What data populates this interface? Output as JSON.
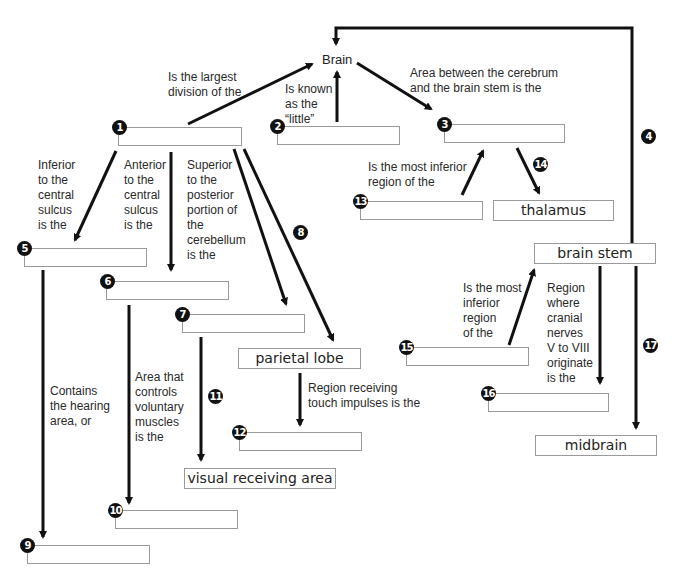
{
  "title": "Brain",
  "blanks": {
    "b1": {
      "number": "1",
      "value": ""
    },
    "b2": {
      "number": "2",
      "value": ""
    },
    "b3": {
      "number": "3",
      "value": ""
    },
    "b5": {
      "number": "5",
      "value": ""
    },
    "b6": {
      "number": "6",
      "value": ""
    },
    "b7": {
      "number": "7",
      "value": ""
    },
    "b9": {
      "number": "9",
      "value": ""
    },
    "b10": {
      "number": "10",
      "value": ""
    },
    "b12": {
      "number": "12",
      "value": ""
    },
    "b13": {
      "number": "13",
      "value": ""
    },
    "b15": {
      "number": "15",
      "value": ""
    },
    "b16": {
      "number": "16",
      "value": ""
    }
  },
  "filled": {
    "thalamus": "thalamus",
    "brain_stem": "brain stem",
    "parietal_lobe": "parietal lobe",
    "visual_receiving_area": "visual receiving area",
    "midbrain": "midbrain"
  },
  "arrow_numbers": {
    "a4": "4",
    "a8": "8",
    "a11": "11",
    "a14": "14",
    "a17": "17"
  },
  "labels": {
    "largest_division": "Is the largest\ndivision of the",
    "known_as_little": "Is known\nas the\n“little”",
    "area_between": "Area between the cerebrum\nand the brain stem is the",
    "inferior_central": "Inferior\nto the\ncentral\nsulcus\nis the",
    "anterior_central": "Anterior\nto the\ncentral\nsulcus\nis the",
    "superior_posterior": "Superior\nto the\nposterior\nportion of\nthe\ncerebellum\nis the",
    "most_inferior_region_13": "Is the most inferior\nregion of the",
    "hearing_area": "Contains\nthe hearing\narea, or",
    "voluntary_muscles": "Area that\ncontrols\nvoluntary\nmuscles\nis the",
    "touch_impulses": "Region receiving\ntouch impulses is the",
    "most_inferior_region_15": "Is the most\ninferior\nregion\nof the",
    "cranial_nerves": "Region\nwhere\ncranial\nnerves\nV to VIII\noriginate\nis the"
  }
}
